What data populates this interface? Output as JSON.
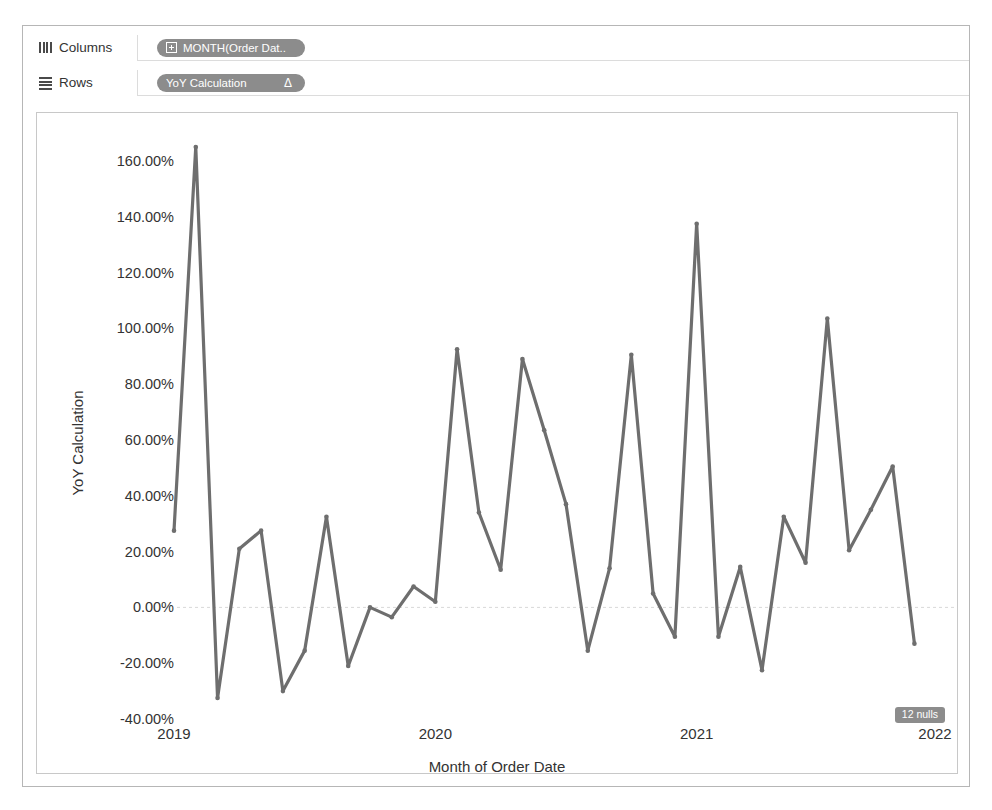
{
  "shelves": {
    "columns": {
      "label": "Columns",
      "icon": "columns-icon",
      "pill": {
        "text": "MONTH(Order Dat..",
        "prefix_icon": "plus-box-icon"
      }
    },
    "rows": {
      "label": "Rows",
      "icon": "rows-icon",
      "pill": {
        "text": "YoY Calculation",
        "suffix_icon": "delta-icon",
        "suffix_glyph": "Δ"
      }
    }
  },
  "chart_data": {
    "type": "line",
    "title": "",
    "xlabel": "Month of Order Date",
    "ylabel": "YoY Calculation",
    "grid": false,
    "zero_line": true,
    "legend_position": "none",
    "ylim": [
      -40,
      170
    ],
    "ytick_labels": [
      "160.00%",
      "140.00%",
      "120.00%",
      "100.00%",
      "80.00%",
      "60.00%",
      "40.00%",
      "20.00%",
      "0.00%",
      "-20.00%",
      "-40.00%"
    ],
    "ytick_values": [
      160,
      140,
      120,
      100,
      80,
      60,
      40,
      20,
      0,
      -20,
      -40
    ],
    "xtick_labels": [
      "2019",
      "2020",
      "2021",
      "2022"
    ],
    "xtick_values": [
      2019,
      2020,
      2021,
      2022
    ],
    "xlim": [
      2019,
      2022
    ],
    "line_color": "#6e6e6e",
    "nulls_note": "12 nulls",
    "series": [
      {
        "name": "YoY Calculation",
        "x": [
          2019.0,
          2019.0833,
          2019.1667,
          2019.25,
          2019.3333,
          2019.4167,
          2019.5,
          2019.5833,
          2019.6667,
          2019.75,
          2019.8333,
          2019.9167,
          2020.0,
          2020.0833,
          2020.1667,
          2020.25,
          2020.3333,
          2020.4167,
          2020.5,
          2020.5833,
          2020.6667,
          2020.75,
          2020.8333,
          2020.9167,
          2021.0,
          2021.0833,
          2021.1667,
          2021.25,
          2021.3333,
          2021.4167,
          2021.5,
          2021.5833,
          2021.6667,
          2021.75,
          2021.8333,
          2021.9167,
          2022.0
        ],
        "values": [
          27.5,
          165.0,
          -32.5,
          21.0,
          27.5,
          -30.0,
          -15.5,
          32.5,
          -21.0,
          0.0,
          -3.5,
          7.5,
          2.0,
          92.5,
          34.0,
          13.5,
          89.0,
          63.5,
          37.0,
          -15.5,
          14.0,
          90.5,
          5.0,
          -10.5,
          137.5,
          -10.5,
          14.5,
          -22.5,
          32.5,
          16.0,
          103.5,
          20.5,
          35.0,
          50.5,
          -13.0,
          null,
          null
        ]
      }
    ]
  }
}
